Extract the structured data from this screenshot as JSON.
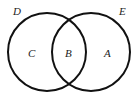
{
  "diagram": {
    "type": "venn",
    "sets": [
      {
        "name": "D",
        "cx": 47,
        "cy": 52,
        "r": 39
      },
      {
        "name": "E",
        "cx": 91,
        "cy": 52,
        "r": 39
      }
    ],
    "set_labels": {
      "left": "D",
      "right": "E"
    },
    "region_labels": {
      "left_only": "C",
      "intersection": "B",
      "right_only": "A"
    },
    "stroke_color": "#111111",
    "background": "#ffffff"
  }
}
